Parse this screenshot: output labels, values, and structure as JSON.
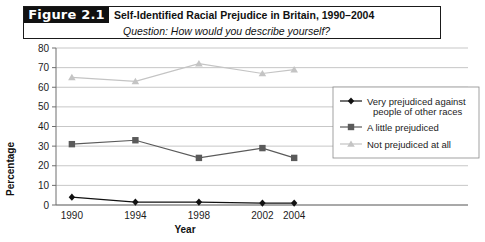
{
  "figure": {
    "tag": "Figure 2.1",
    "title": "Self-Identified Racial Prejudice in Britain, 1990–2004",
    "subtitle": "Question: How would you describe yourself?"
  },
  "chart_data": {
    "type": "line",
    "title": "Self-Identified Racial Prejudice in Britain, 1990–2004",
    "subtitle": "Question: How would you describe yourself?",
    "xlabel": "Year",
    "ylabel": "Percentage",
    "x": [
      1990,
      1994,
      1998,
      2002,
      2004
    ],
    "categories": [
      "1990",
      "1994",
      "1998",
      "2002",
      "2004"
    ],
    "xlim": [
      1989,
      2005.5
    ],
    "ylim": [
      0,
      80
    ],
    "yticks": [
      0,
      10,
      20,
      30,
      40,
      50,
      60,
      70,
      80
    ],
    "ytick_labels": [
      "0",
      "10",
      "20",
      "30",
      "40",
      "50",
      "60",
      "70",
      "80"
    ],
    "grid": "horizontal",
    "legend_position": "right",
    "series": [
      {
        "name": "Very prejudiced against people of other races",
        "values": [
          4,
          1.5,
          1.5,
          1,
          1
        ],
        "color": "#111111",
        "marker": "diamond"
      },
      {
        "name": "A little prejudiced",
        "values": [
          31,
          33,
          24,
          29,
          24
        ],
        "color": "#5a5a5a",
        "marker": "square"
      },
      {
        "name": "Not prejudiced at all",
        "values": [
          65,
          63,
          72,
          67,
          69
        ],
        "color": "#c4c4c4",
        "marker": "triangle"
      }
    ]
  },
  "legend": {
    "items": [
      {
        "label_line1": "Very prejudiced against",
        "label_line2": "people of other races"
      },
      {
        "label_line1": "A little prejudiced",
        "label_line2": ""
      },
      {
        "label_line1": "Not prejudiced at all",
        "label_line2": ""
      }
    ]
  },
  "colors": {
    "series_1": "#111111",
    "series_2": "#5a5a5a",
    "series_3": "#c4c4c4",
    "grid": "#b9b9b9",
    "axis": "#6f6f6f",
    "tag_bg": "#111111"
  }
}
